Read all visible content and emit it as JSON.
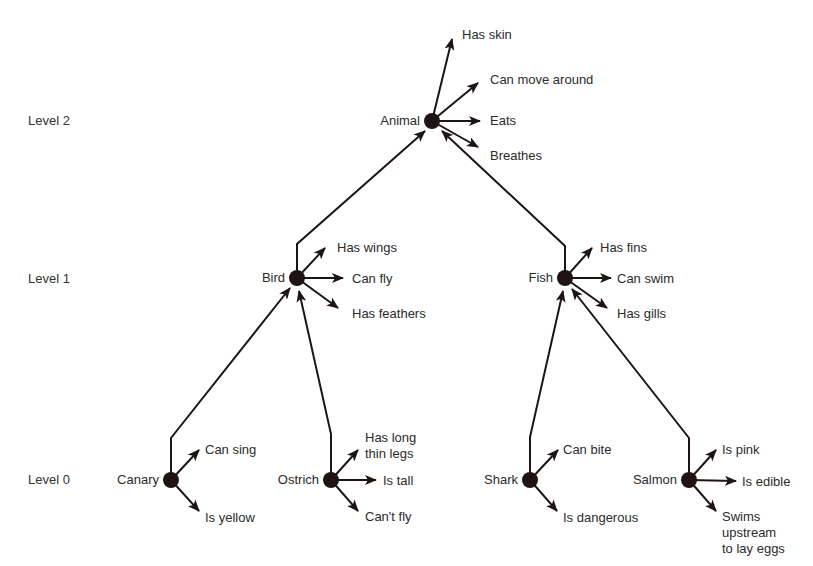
{
  "levels": [
    {
      "label": "Level 2",
      "y": 121
    },
    {
      "label": "Level 1",
      "y": 279
    },
    {
      "label": "Level 0",
      "y": 480
    }
  ],
  "nodes": [
    {
      "id": "animal",
      "label": "Animal",
      "x": 432,
      "y": 121,
      "properties": [
        {
          "label": "Has skin",
          "tx": 452,
          "ty": 39,
          "lx": 462,
          "ly": 27
        },
        {
          "label": "Can move around",
          "tx": 478,
          "ty": 83,
          "lx": 490,
          "ly": 72
        },
        {
          "label": "Eats",
          "tx": 480,
          "ty": 121,
          "lx": 490,
          "ly": 113
        },
        {
          "label": "Breathes",
          "tx": 478,
          "ty": 147,
          "lx": 490,
          "ly": 148
        }
      ]
    },
    {
      "id": "bird",
      "label": "Bird",
      "x": 297,
      "y": 278,
      "properties": [
        {
          "label": "Has wings",
          "tx": 325,
          "ty": 248,
          "lx": 337,
          "ly": 240
        },
        {
          "label": "Can fly",
          "tx": 343,
          "ty": 278,
          "lx": 352,
          "ly": 271
        },
        {
          "label": "Has feathers",
          "tx": 338,
          "ty": 308,
          "lx": 352,
          "ly": 306
        }
      ]
    },
    {
      "id": "fish",
      "label": "Fish",
      "x": 565,
      "y": 278,
      "properties": [
        {
          "label": "Has fins",
          "tx": 592,
          "ty": 248,
          "lx": 600,
          "ly": 240
        },
        {
          "label": "Can swim",
          "tx": 611,
          "ty": 278,
          "lx": 617,
          "ly": 271
        },
        {
          "label": "Has gills",
          "tx": 607,
          "ty": 308,
          "lx": 617,
          "ly": 306
        }
      ]
    },
    {
      "id": "canary",
      "label": "Canary",
      "x": 171,
      "y": 480,
      "properties": [
        {
          "label": "Can sing",
          "tx": 199,
          "ty": 450,
          "lx": 205,
          "ly": 442
        },
        {
          "label": "Is yellow",
          "tx": 199,
          "ty": 511,
          "lx": 205,
          "ly": 510
        }
      ]
    },
    {
      "id": "ostrich",
      "label": "Ostrich",
      "x": 331,
      "y": 480,
      "properties": [
        {
          "label": "Has long\nthin legs",
          "tx": 358,
          "ty": 450,
          "lx": 365,
          "ly": 430
        },
        {
          "label": "Is tall",
          "tx": 376,
          "ty": 480,
          "lx": 383,
          "ly": 473
        },
        {
          "label": "Can't fly",
          "tx": 358,
          "ty": 511,
          "lx": 365,
          "ly": 509
        }
      ]
    },
    {
      "id": "shark",
      "label": "Shark",
      "x": 530,
      "y": 480,
      "properties": [
        {
          "label": "Can bite",
          "tx": 558,
          "ty": 450,
          "lx": 563,
          "ly": 442
        },
        {
          "label": "Is dangerous",
          "tx": 557,
          "ty": 511,
          "lx": 563,
          "ly": 510
        }
      ]
    },
    {
      "id": "salmon",
      "label": "Salmon",
      "x": 689,
      "y": 480,
      "properties": [
        {
          "label": "Is pink",
          "tx": 716,
          "ty": 450,
          "lx": 722,
          "ly": 442
        },
        {
          "label": "Is edible",
          "tx": 736,
          "ty": 481,
          "lx": 742,
          "ly": 474
        },
        {
          "label": "Swims\nupstream\nto lay eggs",
          "tx": 716,
          "ty": 511,
          "lx": 722,
          "ly": 509
        }
      ]
    }
  ],
  "links": [
    {
      "from": "bird",
      "to": "animal",
      "path": [
        [
          297,
          272
        ],
        [
          297,
          244
        ],
        [
          425,
          131
        ]
      ]
    },
    {
      "from": "fish",
      "to": "animal",
      "path": [
        [
          565,
          272
        ],
        [
          565,
          246
        ],
        [
          442,
          131
        ]
      ]
    },
    {
      "from": "canary",
      "to": "bird",
      "path": [
        [
          171,
          474
        ],
        [
          171,
          438
        ],
        [
          290,
          288
        ]
      ]
    },
    {
      "from": "ostrich",
      "to": "bird",
      "path": [
        [
          331,
          474
        ],
        [
          331,
          434
        ],
        [
          299,
          291
        ]
      ]
    },
    {
      "from": "shark",
      "to": "fish",
      "path": [
        [
          530,
          474
        ],
        [
          530,
          437
        ],
        [
          563,
          291
        ]
      ]
    },
    {
      "from": "salmon",
      "to": "fish",
      "path": [
        [
          689,
          474
        ],
        [
          689,
          438
        ],
        [
          572,
          289
        ]
      ]
    }
  ],
  "style": {
    "ink": "#1e1414",
    "node_radius": 8
  }
}
